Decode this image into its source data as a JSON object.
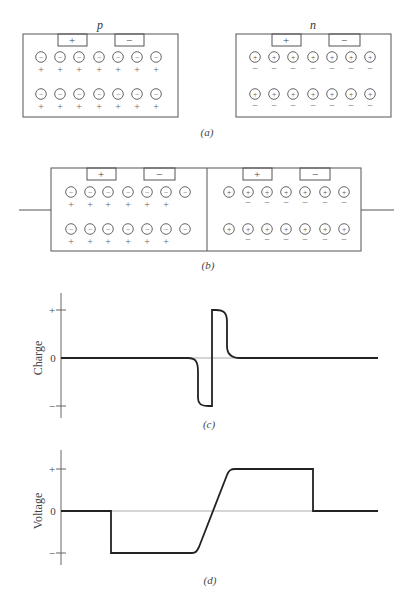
{
  "panel_a": {
    "caption": "(a)",
    "p_block": {
      "label": "p",
      "contact_plus": "+",
      "contact_minus": "−",
      "ion_symbol": "−",
      "carrier_symbol": "+",
      "rows": 2,
      "ions_per_row": 7
    },
    "n_block": {
      "label": "n",
      "contact_plus": "+",
      "contact_minus": "−",
      "ion_symbol": "+",
      "carrier_symbol": "−",
      "rows": 2,
      "ions_per_row": 7
    }
  },
  "panel_b": {
    "caption": "(b)",
    "p_side": {
      "contact_plus": "+",
      "contact_minus": "−",
      "ion_symbol": "−",
      "carrier_symbol": "+",
      "carriers_per_row": 6
    },
    "n_side": {
      "contact_plus": "+",
      "contact_minus": "−",
      "ion_symbol": "+",
      "carrier_symbol": "−",
      "carriers_per_row": 6
    }
  },
  "chart_data": [
    {
      "type": "line",
      "title": "(c)",
      "xlabel": "",
      "ylabel": "Charge",
      "ytick_labels": [
        "+",
        "0",
        "−"
      ],
      "ylim": [
        -1,
        1
      ],
      "grid": false,
      "x": [
        0,
        0.4,
        0.44,
        0.45,
        0.48,
        0.48,
        0.52,
        0.53,
        0.56,
        1.0
      ],
      "values": [
        0,
        0,
        -0.2,
        -0.8,
        -1.0,
        1.0,
        0.8,
        0.2,
        0,
        0
      ],
      "description": "Zero charge away from junction; negative space charge on p side, positive on n side"
    },
    {
      "type": "line",
      "title": "(d)",
      "xlabel": "",
      "ylabel": "Voltage",
      "ytick_labels": [
        "+",
        "0",
        "−"
      ],
      "ylim": [
        -1,
        1
      ],
      "grid": false,
      "x": [
        0,
        0.16,
        0.16,
        0.42,
        0.48,
        0.54,
        0.8,
        0.8,
        1.0
      ],
      "values": [
        0,
        0,
        -1.0,
        -1.0,
        0,
        1.0,
        1.0,
        0,
        0
      ],
      "description": "Voltage steps negative at left contact, ramps through junction, steps back at right contact"
    }
  ]
}
